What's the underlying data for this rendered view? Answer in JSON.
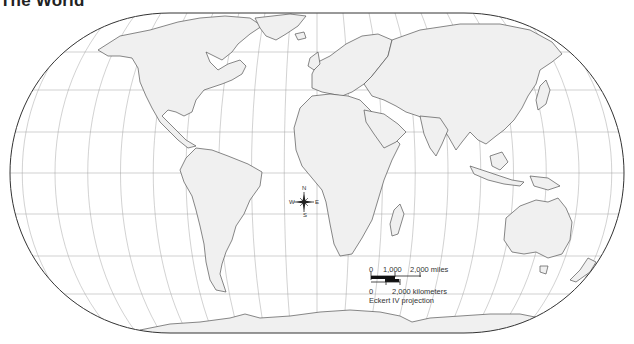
{
  "title": "The World",
  "compass": {
    "n": "N",
    "s": "S",
    "e": "E",
    "w": "W"
  },
  "scale": {
    "miles_zero": "0",
    "miles_mid": "1,000",
    "miles_end": "2,000 miles",
    "km_zero": "0",
    "km_end": "2,000 kilometers",
    "projection": "Eckert IV projection"
  },
  "colors": {
    "land": "#f0f0f0",
    "ocean": "#ffffff",
    "coastline": "#555555",
    "graticule": "#9a9a9a",
    "frame": "#333333"
  }
}
